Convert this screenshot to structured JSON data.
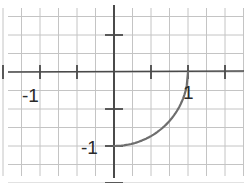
{
  "chart_data": {
    "type": "line",
    "title": "",
    "xlabel": "",
    "ylabel": "",
    "function": "y = -sqrt(1 - x^2)",
    "domain": [
      0,
      1
    ],
    "series": [
      {
        "name": "quarter circle",
        "color": "#6e6e6e",
        "x": [
          0,
          0.1,
          0.2,
          0.3,
          0.4,
          0.5,
          0.6,
          0.7,
          0.8,
          0.9,
          0.95,
          1.0
        ],
        "y": [
          -1,
          -0.995,
          -0.98,
          -0.954,
          -0.917,
          -0.866,
          -0.8,
          -0.714,
          -0.6,
          -0.436,
          -0.312,
          0
        ]
      }
    ],
    "xlim": [
      -1.54,
      1.76
    ],
    "ylim": [
      -1.5,
      0.97
    ],
    "grid": true,
    "grid_spacing": 0.25,
    "tick_spacing": 0.5,
    "x_tick_labels": [
      {
        "value": -1,
        "text": "-1"
      },
      {
        "value": 1,
        "text": "1"
      }
    ],
    "y_tick_labels": [
      {
        "value": -1,
        "text": "-1"
      }
    ],
    "colors": {
      "grid": "#c4c4c4",
      "axis": "#4a4a4a",
      "curve": "#6e6e6e",
      "label": "#2a2a2a"
    }
  },
  "labels": {
    "x_neg1": "-1",
    "x_pos1": "1",
    "y_neg1": "-1"
  }
}
